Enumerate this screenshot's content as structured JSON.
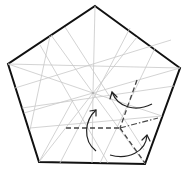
{
  "diagram": {
    "type": "origami-fold-diagram",
    "shape": "pentagon",
    "colors": {
      "outline": "#111111",
      "crease": "#c8c8c8",
      "fold_line": "#444444",
      "arrow": "#222222",
      "background": "#ffffff"
    },
    "vertices": [
      [
        95,
        6
      ],
      [
        180,
        68
      ],
      [
        145,
        164
      ],
      [
        39,
        162
      ],
      [
        8,
        64
      ]
    ],
    "center": [
      93,
      93
    ],
    "fold_point": [
      120,
      128
    ],
    "fold_lines": [
      {
        "kind": "valley",
        "from": [
          66,
          128
        ],
        "to": [
          120,
          128
        ]
      },
      {
        "kind": "valley",
        "from": [
          137,
          80
        ],
        "to": [
          120,
          128
        ]
      },
      {
        "kind": "valley",
        "from": [
          120,
          128
        ],
        "to": [
          145,
          163
        ]
      },
      {
        "kind": "mountain",
        "from": [
          120,
          128
        ],
        "to": [
          158,
          118
        ]
      }
    ],
    "arrows": [
      {
        "name": "arrow-left-fold",
        "direction": "up"
      },
      {
        "name": "arrow-upper-right-fold",
        "direction": "up-left"
      },
      {
        "name": "arrow-bottom-right-fold",
        "direction": "up-right"
      }
    ]
  }
}
